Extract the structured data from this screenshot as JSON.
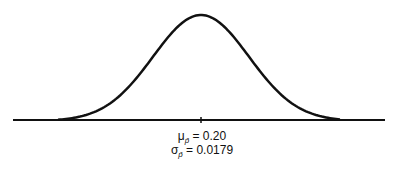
{
  "chart_data": {
    "type": "line",
    "title": "",
    "xlabel": "",
    "ylabel": "",
    "grid": false,
    "mean_label": {
      "symbol": "μ",
      "subscript": "p̂",
      "value": "= 0.20"
    },
    "sd_label": {
      "symbol": "σ",
      "subscript": "p̂",
      "value": "= 0.0179"
    },
    "mean": 0.2,
    "sd": 0.0179,
    "x_tick": [
      0.2
    ],
    "x_range_approx": [
      0.145,
      0.255
    ]
  },
  "colors": {
    "line": "#111111",
    "background": "#ffffff"
  }
}
